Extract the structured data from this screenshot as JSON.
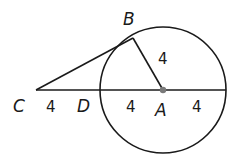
{
  "diagram": {
    "title": "",
    "points": {
      "A": {
        "label": "A",
        "x": 163,
        "y": 90
      },
      "B": {
        "label": "B",
        "x": 133,
        "y": 38
      },
      "C": {
        "label": "C",
        "x": 36,
        "y": 90
      },
      "D": {
        "label": "D",
        "x": 100,
        "y": 90
      }
    },
    "circle": {
      "center": "A",
      "cx": 163,
      "cy": 90,
      "r": 63
    },
    "segments": [
      {
        "from": "C",
        "to": "B",
        "name": "tangent CB"
      },
      {
        "from": "B",
        "to": "A",
        "name": "radius AB",
        "length_label": "4"
      },
      {
        "from": "C",
        "to": "D",
        "name": "CD",
        "length_label": "4"
      },
      {
        "from": "D",
        "to": "A",
        "name": "radius DA",
        "length_label": "4"
      },
      {
        "from": "A",
        "to": "E",
        "name": "radius to right edge",
        "length_label": "4"
      }
    ],
    "labels": {
      "B": "B",
      "C": "C",
      "D": "D",
      "A": "A",
      "len_AB": "4",
      "len_CD": "4",
      "len_DA": "4",
      "len_AE": "4"
    },
    "colors": {
      "stroke": "#1a1a1a",
      "center_dot": "#7a7a7a",
      "background": "#ffffff"
    }
  }
}
